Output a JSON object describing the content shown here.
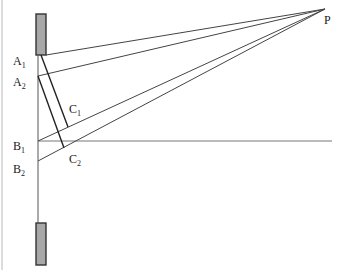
{
  "diagram": {
    "labels": {
      "A1": {
        "base": "A",
        "sub": "1"
      },
      "A2": {
        "base": "A",
        "sub": "2"
      },
      "B1": {
        "base": "B",
        "sub": "1"
      },
      "B2": {
        "base": "B",
        "sub": "2"
      },
      "C1": {
        "base": "C",
        "sub": "1"
      },
      "C2": {
        "base": "C",
        "sub": "2"
      },
      "P": {
        "base": "P"
      }
    },
    "colors": {
      "line": "#333333",
      "block_fill": "#a8a8a8",
      "block_stroke": "#333333",
      "horizontal": "#777777",
      "edge": "#cccccc"
    }
  }
}
